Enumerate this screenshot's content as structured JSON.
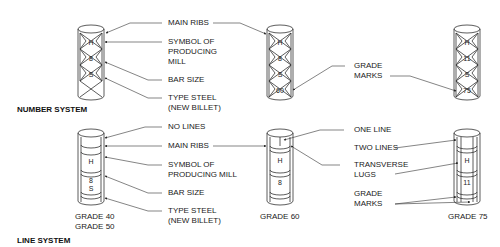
{
  "number_system": {
    "title": "NUMBER SYSTEM",
    "labels": {
      "main_ribs": "MAIN RIBS",
      "symbol_mill": [
        "SYMBOL OF",
        "PRODUCING",
        "MILL"
      ],
      "bar_size": "BAR SIZE",
      "type_steel": [
        "TYPE STEEL",
        "(NEW BILLET)"
      ],
      "grade_marks": [
        "GRADE",
        "MARKS"
      ]
    },
    "bars": [
      {
        "marks": [
          "H",
          "8",
          "S"
        ],
        "grade_mark": ""
      },
      {
        "marks": [
          "H",
          "8",
          "S"
        ],
        "grade_mark": "60"
      },
      {
        "marks": [
          "H",
          "11",
          "S"
        ],
        "grade_mark": "75"
      }
    ]
  },
  "line_system": {
    "title": "LINE SYSTEM",
    "labels": {
      "no_lines": "NO LINES",
      "main_ribs": "MAIN RIBS",
      "symbol_mill": [
        "SYMBOL OF",
        "PRODUCING MILL"
      ],
      "bar_size": "BAR SIZE",
      "type_steel": [
        "TYPE STEEL",
        "(NEW BILLET)"
      ],
      "one_line": "ONE LINE",
      "two_lines": "TWO LINES",
      "transverse_lugs": [
        "TRANSVERSE",
        "LUGS"
      ],
      "grade_marks": [
        "GRADE",
        "MARKS"
      ]
    },
    "bars": [
      {
        "marks": [
          "H",
          "8",
          "S"
        ],
        "captions": [
          "GRADE 40",
          "GRADE 50"
        ]
      },
      {
        "marks": [
          "H",
          "8",
          "S"
        ],
        "captions": [
          "GRADE 60"
        ]
      },
      {
        "marks": [
          "H",
          "11",
          "S"
        ],
        "captions": [
          "GRADE 75"
        ]
      }
    ]
  }
}
